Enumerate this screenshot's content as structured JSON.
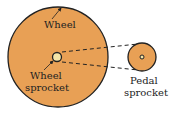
{
  "labels": {
    "wheel": "Wheel",
    "wheel_sprocket_line1": "Wheel",
    "wheel_sprocket_line2": "sprocket",
    "pedal_sprocket_line1": "Pedal",
    "pedal_sprocket_line2": "sprocket"
  },
  "colors": {
    "wheel_fill": "#e8a055",
    "sprocket_fill": "#f5e6a8",
    "stroke": "#222222"
  }
}
